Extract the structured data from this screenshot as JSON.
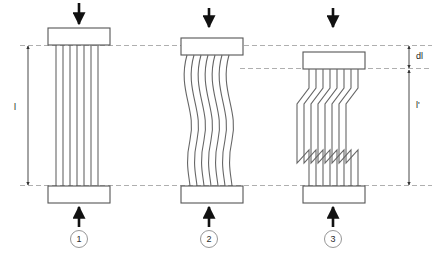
{
  "figure": {
    "caption_title": "Compressive failure of unidirectional fiber composite",
    "background_color": "#ffffff",
    "line_color": "#555555",
    "arrow_color": "#111111",
    "dashed_color": "#9a9a9a",
    "text_color": "#1a1a1a"
  },
  "dimensions": {
    "original_length_label": "l",
    "deformed_length_label": "l'",
    "shortening_label": "dl"
  },
  "stages": [
    {
      "id": "stage-1",
      "number": "1",
      "name": "undeformed-straight-fibers",
      "top_arrow": "down-arrow",
      "bottom_arrow": "up-arrow",
      "fiber_count": 7,
      "fiber_mode": "straight"
    },
    {
      "id": "stage-2",
      "number": "2",
      "name": "elastic-microbuckling-sinusoidal",
      "top_arrow": "down-arrow",
      "bottom_arrow": "up-arrow",
      "fiber_count": 7,
      "fiber_mode": "sinusoidal"
    },
    {
      "id": "stage-3",
      "number": "3",
      "name": "kink-band-formation",
      "top_arrow": "down-arrow",
      "bottom_arrow": "up-arrow",
      "fiber_count": 7,
      "fiber_mode": "kink-band"
    }
  ],
  "reference_lines": [
    {
      "name": "top-datum-line",
      "style": "dashed"
    },
    {
      "name": "stage3-top-plate-datum-line",
      "style": "dashed"
    },
    {
      "name": "bottom-datum-line",
      "style": "dashed"
    }
  ]
}
